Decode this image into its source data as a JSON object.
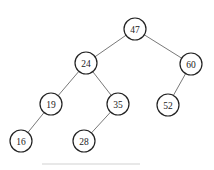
{
  "diagram": {
    "type": "binary-search-tree",
    "node_radius": 11,
    "colors": {
      "stroke": "#222222",
      "edge": "#555555",
      "fill": "#ffffff",
      "text": "#222222"
    },
    "nodes": [
      {
        "id": "n47",
        "label": "47",
        "x": 135,
        "y": 29
      },
      {
        "id": "n24",
        "label": "24",
        "x": 86,
        "y": 63
      },
      {
        "id": "n60",
        "label": "60",
        "x": 191,
        "y": 64
      },
      {
        "id": "n19",
        "label": "19",
        "x": 51,
        "y": 104
      },
      {
        "id": "n35",
        "label": "35",
        "x": 118,
        "y": 104
      },
      {
        "id": "n52",
        "label": "52",
        "x": 168,
        "y": 105
      },
      {
        "id": "n16",
        "label": "16",
        "x": 21,
        "y": 141
      },
      {
        "id": "n28",
        "label": "28",
        "x": 84,
        "y": 141
      }
    ],
    "edges": [
      {
        "from": "n47",
        "to": "n24"
      },
      {
        "from": "n47",
        "to": "n60"
      },
      {
        "from": "n24",
        "to": "n19"
      },
      {
        "from": "n24",
        "to": "n35"
      },
      {
        "from": "n60",
        "to": "n52"
      },
      {
        "from": "n19",
        "to": "n16"
      },
      {
        "from": "n35",
        "to": "n28"
      }
    ]
  }
}
